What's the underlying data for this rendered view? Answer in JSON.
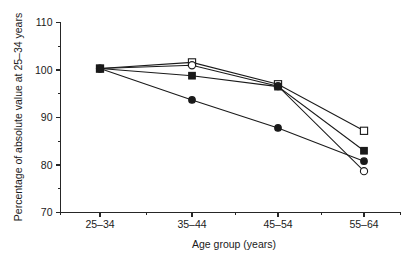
{
  "chart_data": {
    "type": "line",
    "title": "",
    "xlabel": "Age group (years)",
    "ylabel": "Percentage of absolute value at 25–34 years",
    "categories": [
      "25–34",
      "35–44",
      "45–54",
      "55–64"
    ],
    "ylim": [
      70,
      110
    ],
    "yticks": [
      70,
      80,
      90,
      100,
      110
    ],
    "ytick_labels": [
      "70",
      "80",
      "90",
      "100",
      "110"
    ],
    "yticks_minor": [
      75,
      85,
      95,
      105
    ],
    "grid": false,
    "legend": "none",
    "series": [
      {
        "name": "open-square",
        "marker": "open-square",
        "values": [
          100.3,
          101.6,
          97.0,
          87.2
        ]
      },
      {
        "name": "open-circle",
        "marker": "open-circle",
        "values": [
          100.3,
          101.0,
          96.6,
          78.7
        ]
      },
      {
        "name": "filled-square",
        "marker": "filled-square",
        "values": [
          100.3,
          98.8,
          96.5,
          83.0
        ]
      },
      {
        "name": "filled-circle",
        "marker": "filled-circle",
        "values": [
          100.3,
          93.7,
          87.8,
          80.8
        ]
      }
    ]
  },
  "axis": {
    "x_title": "Age group (years)",
    "y_title": "Percentage of absolute value at 25–34 years",
    "y_labels": [
      "110",
      "100",
      "90",
      "80",
      "70"
    ],
    "x_labels": [
      "25–34",
      "35–44",
      "45–54",
      "55–64"
    ]
  },
  "colors": {
    "axis": "#262626",
    "line": "#1a1a1a",
    "marker_fill_open": "#ffffff",
    "marker_fill_solid": "#1a1a1a",
    "background": "#ffffff"
  }
}
